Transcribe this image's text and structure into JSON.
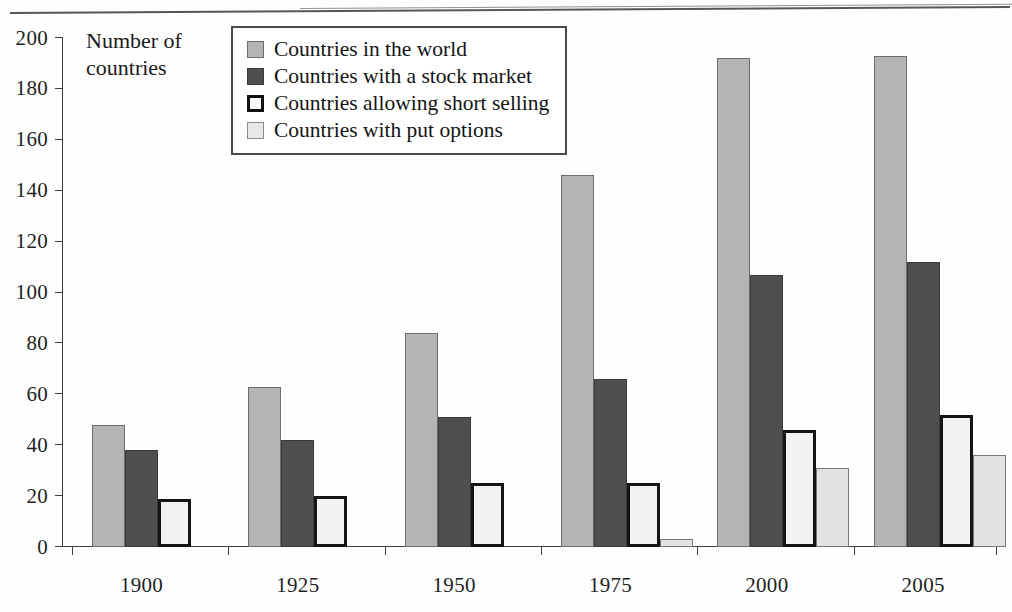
{
  "chart_data": {
    "type": "bar",
    "title": "",
    "subtitle": "",
    "xlabel": "",
    "ylabel": "Number of countries",
    "ylim": [
      0,
      200
    ],
    "ytick_step": 20,
    "yticks": [
      0,
      20,
      40,
      60,
      80,
      100,
      120,
      140,
      160,
      180,
      200
    ],
    "grid": false,
    "legend_position": "top-center-inside",
    "categories": [
      "1900",
      "1925",
      "1950",
      "1975",
      "2000",
      "2005"
    ],
    "series": [
      {
        "name": "Countries in the world",
        "swatch": "light-gray-filled",
        "color": "#b4b4b4",
        "values": [
          48,
          63,
          84,
          146,
          192,
          193
        ]
      },
      {
        "name": "Countries with a stock market",
        "swatch": "dark-gray-filled",
        "color": "#4f4f4f",
        "values": [
          38,
          42,
          51,
          66,
          107,
          112
        ]
      },
      {
        "name": "Countries allowing short selling",
        "swatch": "white-thick-black-outline",
        "color": "#f2f2f2",
        "values": [
          19,
          20,
          25,
          25,
          46,
          52
        ]
      },
      {
        "name": "Countries with put options",
        "swatch": "very-light-gray-thin-outline",
        "color": "#e2e2e2",
        "values": [
          0,
          0,
          0,
          3,
          31,
          36
        ]
      }
    ]
  },
  "axis_title": {
    "line1": "Number of",
    "line2": "countries"
  },
  "legend": {
    "items": [
      {
        "label": "Countries in the world"
      },
      {
        "label": "Countries with a stock market"
      },
      {
        "label": "Countries allowing short selling"
      },
      {
        "label": "Countries with put options"
      }
    ]
  }
}
